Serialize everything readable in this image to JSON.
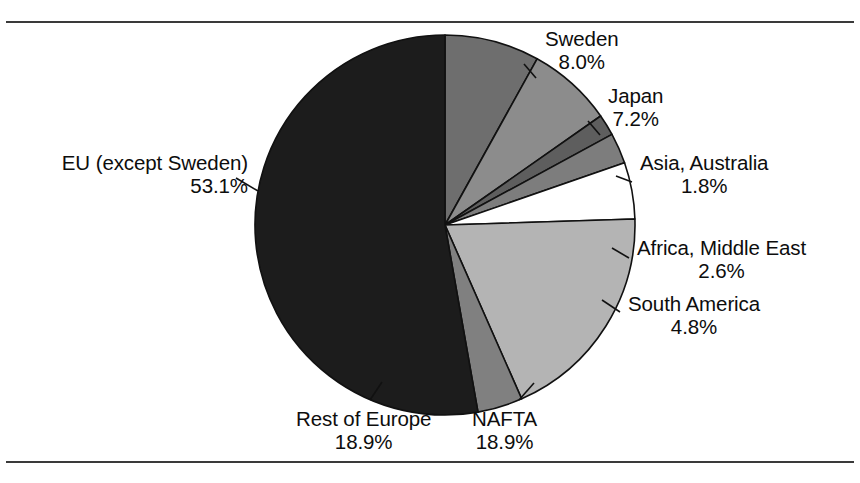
{
  "figure": {
    "background_color": "#ffffff",
    "frame_color": "#3a3a3a",
    "text_color": "#0d0d0d"
  },
  "chart_data": {
    "type": "pie",
    "title": "",
    "subtitle": "",
    "xlabel": "",
    "ylabel": "",
    "legend_position": "none",
    "grid": false,
    "labels_outside": true,
    "leader_lines": true,
    "start_angle_deg": 0,
    "direction": "clockwise",
    "center": {
      "x": 445,
      "y": 225
    },
    "radius": 190,
    "categories": [
      "Sweden",
      "Japan",
      "Asia, Australia",
      "Africa, Middle East",
      "South America",
      "NAFTA",
      "Rest of Europe",
      "EU (except Sweden)"
    ],
    "values": [
      8.0,
      7.2,
      1.8,
      2.6,
      4.8,
      18.9,
      18.9,
      53.1
    ],
    "value_labels": [
      "8.0%",
      "7.2%",
      "1.8%",
      "2.6%",
      "4.8%",
      "18.9%",
      "18.9%",
      "53.1%"
    ],
    "slice_colors": [
      "#6e6e6e",
      "#8c8c8c",
      "#5e5e5e",
      "#7d7d7d",
      "#ffffff",
      "#b4b4b4",
      "#808080",
      "#1c1c1c"
    ],
    "slice_sweep_deg": [
      29.0,
      26.0,
      6.5,
      9.4,
      17.3,
      68.0,
      13.8,
      190.0
    ],
    "slice_edge_color": "#111111",
    "slices": [
      {
        "name": "Sweden",
        "value": 8.0,
        "value_label": "8.0%",
        "color": "#6e6e6e",
        "sweep_deg": 29.0
      },
      {
        "name": "Japan",
        "value": 7.2,
        "value_label": "7.2%",
        "color": "#8c8c8c",
        "sweep_deg": 26.0
      },
      {
        "name": "Asia, Australia",
        "value": 1.8,
        "value_label": "1.8%",
        "color": "#5e5e5e",
        "sweep_deg": 6.5
      },
      {
        "name": "Africa, Middle East",
        "value": 2.6,
        "value_label": "2.6%",
        "color": "#7d7d7d",
        "sweep_deg": 9.4
      },
      {
        "name": "South America",
        "value": 4.8,
        "value_label": "4.8%",
        "color": "#ffffff",
        "sweep_deg": 17.3
      },
      {
        "name": "NAFTA",
        "value": 18.9,
        "value_label": "18.9%",
        "color": "#b4b4b4",
        "sweep_deg": 68.0
      },
      {
        "name": "Rest of Europe",
        "value": 18.9,
        "value_label": "18.9%",
        "color": "#808080",
        "sweep_deg": 13.8
      },
      {
        "name": "EU (except Sweden)",
        "value": 53.1,
        "value_label": "53.1%",
        "color": "#1c1c1c",
        "sweep_deg": 190.0
      }
    ]
  }
}
